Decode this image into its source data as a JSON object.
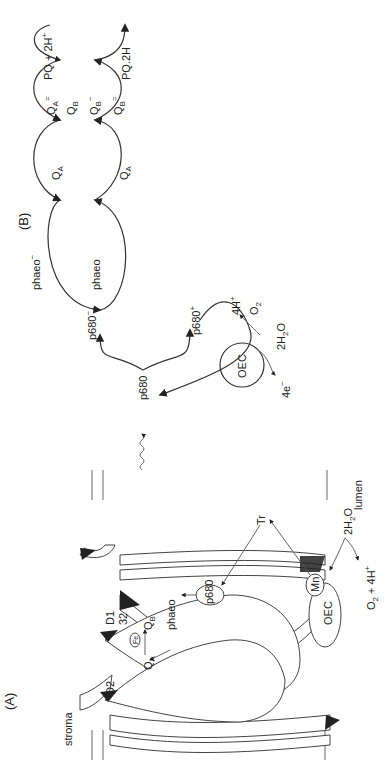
{
  "figure": {
    "orientation": "rotated 90deg counter-clockwise",
    "panel_a": {
      "label": "(A)",
      "region_labels": {
        "stroma": "stroma",
        "lumen": "lumen"
      },
      "proteins": {
        "d1": "D1",
        "d1_sub": "32",
        "d2": "D2",
        "oec": "OEC"
      },
      "cofactors": {
        "fe": "Fe",
        "qa": "Q",
        "qa_sub": "A",
        "qb": "Q",
        "qb_sub": "B",
        "phaeo": "phaeo",
        "p680": "p680",
        "mn": "Mn",
        "tr": "Tr"
      },
      "reaction": {
        "water": "2H",
        "water_sub": "2",
        "water_tail": "O",
        "products": "O",
        "products_sub": "2",
        "products_tail": " + 4H",
        "products_sup": "+"
      }
    },
    "panel_b": {
      "label": "(B)",
      "light_arrow": "hv",
      "p680": "p680",
      "p680_minus": "p680",
      "p680_minus_sup": "−",
      "p680_plus": "p680",
      "p680_plus_sup": "+",
      "oec": "OEC",
      "four_e": "4e",
      "four_e_sup": "−",
      "water": "2H",
      "water_sub": "2",
      "water_tail": "O",
      "four_h": "4H",
      "four_h_sup": "+",
      "o2": "O",
      "o2_sub": "2",
      "phaeo_minus": "phaeo",
      "phaeo_minus_sup": "−",
      "phaeo": "phaeo",
      "qa": "Q",
      "qa_sub": "A",
      "qa_minus": "Q",
      "qa_minus_sub": "A",
      "qa_minus_sup": "−",
      "qa_2minus": "Q",
      "qa_2minus_sub": "A",
      "qa_2minus_sup": "=",
      "qb": "Q",
      "qb_sub": "B",
      "qb_minus": "Q",
      "qb_minus_sub": "B",
      "qb_minus_sup": "−",
      "qb_2minus": "Q",
      "qb_2minus_sub": "B",
      "qb_2minus_sup": "=",
      "pq_in": "PQ + 2H",
      "pq_in_sup": "+",
      "pq_out": "PQ.2H"
    }
  }
}
